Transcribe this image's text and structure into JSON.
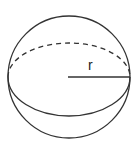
{
  "diagram": {
    "labels": {
      "radius": "r"
    },
    "colors": {
      "stroke": "#333333",
      "background": "#ffffff"
    }
  }
}
